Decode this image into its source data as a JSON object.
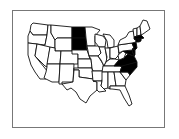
{
  "map": {
    "type": "choropleth",
    "region": "United States (contiguous)",
    "fill_color": "#000000",
    "empty_color": "#ffffff",
    "border_color": "#111111",
    "frame_color": "#777777",
    "highlighted_states": [
      "North Dakota",
      "South Dakota",
      "New Jersey",
      "Delaware",
      "Maryland",
      "Virginia",
      "North Carolina",
      "Massachusetts",
      "Connecticut",
      "Rhode Island"
    ]
  }
}
